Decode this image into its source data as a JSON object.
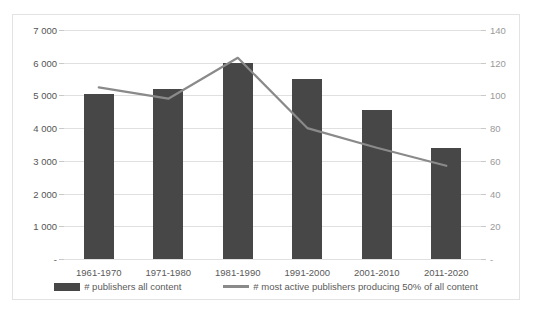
{
  "chart_data": {
    "type": "bar",
    "title": "",
    "xlabel": "",
    "ylabel": "",
    "grid": true,
    "legend_position": "bottom",
    "categories": [
      "1961-1970",
      "1971-1980",
      "1981-1990",
      "1991-2000",
      "2001-2010",
      "2011-2020"
    ],
    "series": [
      {
        "name": "# publishers all content",
        "type": "bar",
        "axis": "left",
        "color": "#474747",
        "values": [
          5050,
          5200,
          6000,
          5500,
          4550,
          3400
        ]
      },
      {
        "name": "# most active publishers producing 50% of all content",
        "type": "line",
        "axis": "right",
        "color": "#8a8a8a",
        "values": [
          105,
          98,
          123,
          80,
          68,
          57
        ]
      }
    ],
    "left_axis": {
      "ylim": [
        0,
        7000
      ],
      "ticks": [
        0,
        1000,
        2000,
        3000,
        4000,
        5000,
        6000,
        7000
      ],
      "tick_labels": [
        "-",
        "1 000",
        "2 000",
        "3 000",
        "4 000",
        "5 000",
        "6 000",
        "7 000"
      ]
    },
    "right_axis": {
      "ylim": [
        0,
        140
      ],
      "ticks": [
        0,
        20,
        40,
        60,
        80,
        100,
        120,
        140
      ],
      "tick_labels": [
        "-",
        "20",
        "40",
        "60",
        "80",
        "100",
        "120",
        "140"
      ]
    }
  }
}
